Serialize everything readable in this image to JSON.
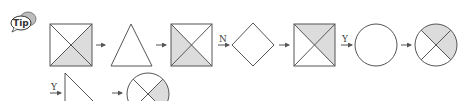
{
  "tip_badge": {
    "text": "Tip"
  },
  "colors": {
    "line": "#555555",
    "shade": "#dcdcdc",
    "background": "#ffffff"
  },
  "sequence_row1": [
    {
      "shape": "square-x",
      "shaded": [
        "right",
        "bottom"
      ]
    },
    {
      "connector": "arrow",
      "label": ""
    },
    {
      "shape": "triangle"
    },
    {
      "connector": "arrow",
      "label": ""
    },
    {
      "shape": "square-x",
      "shaded": [
        "left",
        "bottom"
      ]
    },
    {
      "connector": "arrow",
      "label": "N"
    },
    {
      "shape": "diamond"
    },
    {
      "connector": "arrow",
      "label": ""
    },
    {
      "shape": "square-x",
      "shaded": [
        "top",
        "right"
      ]
    },
    {
      "connector": "arrow",
      "label": "Y"
    },
    {
      "shape": "circle"
    },
    {
      "connector": "arrow",
      "label": ""
    },
    {
      "shape": "circle-x",
      "shaded": [
        "top",
        "right"
      ]
    }
  ],
  "sequence_row2": [
    {
      "connector": "arrow",
      "label": "Y"
    },
    {
      "shape": "right-triangle (cropped)"
    },
    {
      "connector": "arrow",
      "label": ""
    },
    {
      "shape": "circle-x (cropped)",
      "shaded": [
        "right"
      ]
    }
  ],
  "labels": {
    "n": "N",
    "y1": "Y",
    "y2": "Y"
  }
}
